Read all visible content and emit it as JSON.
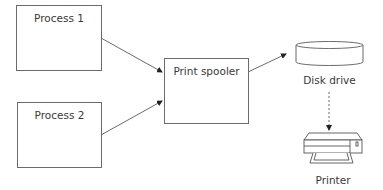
{
  "diagram": {
    "title": "",
    "nodes": [
      {
        "id": "process1",
        "label": "Process 1",
        "shape": "rectangle"
      },
      {
        "id": "process2",
        "label": "Process 2",
        "shape": "rectangle"
      },
      {
        "id": "spooler",
        "label": "Print spooler",
        "shape": "rectangle"
      },
      {
        "id": "disk",
        "label": "Disk drive",
        "shape": "cylinder",
        "icon": "disk-drive-icon"
      },
      {
        "id": "printer",
        "label": "Printer",
        "shape": "printer",
        "icon": "printer-icon"
      }
    ],
    "edges": [
      {
        "from": "process1",
        "to": "spooler",
        "style": "solid",
        "arrow": "end"
      },
      {
        "from": "process2",
        "to": "spooler",
        "style": "solid",
        "arrow": "end"
      },
      {
        "from": "spooler",
        "to": "disk",
        "style": "solid",
        "arrow": "end"
      },
      {
        "from": "disk",
        "to": "printer",
        "style": "dashed",
        "arrow": "end"
      }
    ],
    "colors": {
      "stroke": "#6b6b6b",
      "text": "#3a3a3a",
      "background": "#ffffff"
    }
  }
}
